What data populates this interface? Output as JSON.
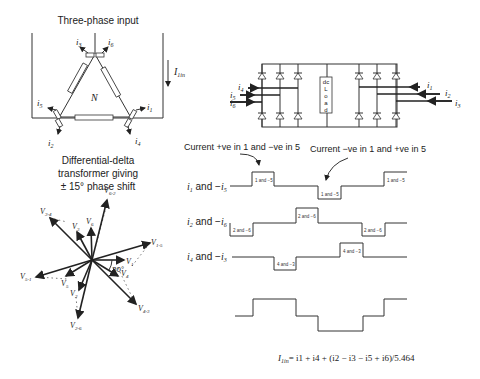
{
  "transformer": {
    "title": "Three-phase input",
    "neutral_label": "N",
    "input_current_label": "I",
    "input_current_sub": "1in",
    "currents": [
      {
        "name": "i",
        "sub": "3"
      },
      {
        "name": "i",
        "sub": "6"
      },
      {
        "name": "i",
        "sub": "5"
      },
      {
        "name": "i",
        "sub": "1"
      },
      {
        "name": "i",
        "sub": "2"
      },
      {
        "name": "i",
        "sub": "4"
      }
    ],
    "caption_lines": [
      "Differential-delta",
      "transformer giving",
      "± 15° phase shift"
    ]
  },
  "phasor": {
    "angle_label": "30°",
    "vectors": [
      {
        "name": "V",
        "sub": "6-2"
      },
      {
        "name": "V",
        "sub": "3-4"
      },
      {
        "name": "V",
        "sub": "3"
      },
      {
        "name": "V",
        "sub": "6"
      },
      {
        "name": "V",
        "sub": "1-5"
      },
      {
        "name": "V",
        "sub": "1"
      },
      {
        "name": "V",
        "sub": "4"
      },
      {
        "name": "V",
        "sub": "5-1"
      },
      {
        "name": "V",
        "sub": "5"
      },
      {
        "name": "V",
        "sub": "2"
      },
      {
        "name": "V",
        "sub": "4-3"
      },
      {
        "name": "V",
        "sub": "2-6"
      }
    ]
  },
  "bridge": {
    "load_label": [
      "dc",
      "L",
      "o",
      "a",
      "d"
    ],
    "left_inputs": [
      {
        "name": "i",
        "sub": "4"
      },
      {
        "name": "i",
        "sub": "5"
      },
      {
        "name": "i",
        "sub": "6"
      }
    ],
    "right_inputs": [
      {
        "name": "i",
        "sub": "1"
      },
      {
        "name": "i",
        "sub": "2"
      },
      {
        "name": "i",
        "sub": "3"
      }
    ]
  },
  "waveforms": {
    "annotation_pos": "Current +ve in 1 and −ve in 5",
    "annotation_neg": "Current −ve in 1 and +ve in 5",
    "rows": [
      {
        "label": "i1 and −i5",
        "a": "i",
        "as": "1",
        "b": "i",
        "bs": "5",
        "step_label": "1 and −5"
      },
      {
        "label": "i2 and −i6",
        "a": "i",
        "as": "2",
        "b": "i",
        "bs": "6",
        "step_label": "2 and −6"
      },
      {
        "label": "i4 and −i3",
        "a": "i",
        "as": "4",
        "b": "i",
        "bs": "3",
        "step_label": "4 and −3"
      }
    ],
    "formula": {
      "lhs": "I",
      "lhs_sub": "1in",
      "rhs": "= i1 + i4 + (i2 − i3 − i5 + i6)/5.464",
      "divisor": "5.464"
    }
  }
}
